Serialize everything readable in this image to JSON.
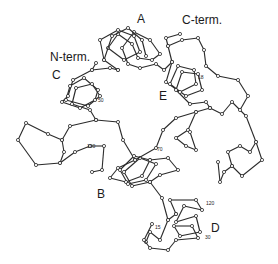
{
  "diagram": {
    "type": "protein C-alpha backbone trace",
    "labels": {
      "n_term": "N-term.",
      "c_term": "C-term.",
      "helix_a": "A",
      "helix_b": "B",
      "helix_c": "C",
      "helix_d": "D",
      "helix_e": "E"
    },
    "residue_numbers": {
      "r_c_side": "50",
      "r_left": "100",
      "r_mid": "70",
      "r_e": "18",
      "r_d_top": "120",
      "r_d_bottom": "30",
      "r_d_left": "15"
    },
    "colors": {
      "line": "#2a2a2a",
      "background": "#ffffff"
    }
  }
}
